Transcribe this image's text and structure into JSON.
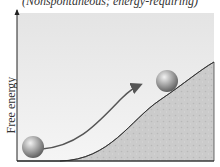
{
  "caption": "(Nonspontaneous; energy-requiring)",
  "axis": {
    "y_label": "Free energy"
  },
  "diagram": {
    "colors": {
      "panel_top": "#e6e6e6",
      "panel_bottom": "#f4f4f4",
      "hill": "#c9c9c9",
      "arrow": "#555555",
      "ball_light": "#e8e8e8",
      "ball_dark": "#6b6b6b"
    }
  }
}
